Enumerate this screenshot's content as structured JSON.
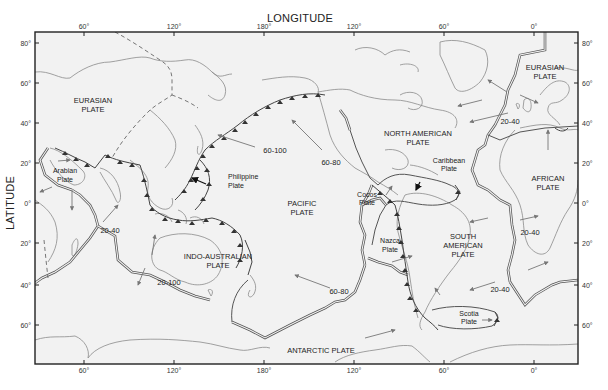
{
  "figure": {
    "x_axis_title": "LONGITUDE",
    "y_axis_title": "LATITUDE",
    "top_ticks": [
      "60°",
      "120°",
      "180°",
      "120°",
      "60°",
      "0°"
    ],
    "bottom_ticks": [
      "60°",
      "120°",
      "180°",
      "120°",
      "60°",
      "0°"
    ],
    "left_ticks": [
      "80°",
      "60°",
      "40°",
      "20°",
      "0°",
      "20°",
      "40°",
      "60°"
    ],
    "right_ticks": [
      "80°",
      "60°",
      "40°",
      "20°",
      "0°",
      "20°",
      "40°",
      "60°"
    ],
    "colors": {
      "background": "#ffffff",
      "map_fill": "#f2f2f2",
      "frame": "#222222",
      "coastline": "#8a8a8a",
      "plate_boundary": "#555555",
      "motion_arrow": "#777777"
    }
  },
  "plates": {
    "eurasian_west": [
      "EURASIAN",
      "PLATE"
    ],
    "eurasian_east": [
      "EURASIAN",
      "PLATE"
    ],
    "north_american": [
      "NORTH AMERICAN",
      "PLATE"
    ],
    "pacific": [
      "PACIFIC",
      "PLATE"
    ],
    "african": [
      "AFRICAN",
      "PLATE"
    ],
    "south_american": [
      "SOUTH",
      "AMERICAN",
      "PLATE"
    ],
    "indo_australian": [
      "INDO-AUSTRALIAN",
      "PLATE"
    ],
    "antarctic": [
      "ANTARCTIC PLATE"
    ],
    "arabian": [
      "Arabian",
      "Plate"
    ],
    "philippine": [
      "Philippine",
      "Plate"
    ],
    "caribbean": [
      "Caribbean",
      "Plate"
    ],
    "cocos": [
      "Cocos",
      "Plate"
    ],
    "nazca": [
      "Nazca",
      "Plate"
    ],
    "scotia": [
      "Scotia",
      "Plate"
    ]
  },
  "rates": {
    "pacific_nw": "60-100",
    "pacific_ne": "60-80",
    "pacific_s": "60-80",
    "indian_ocean": "20-40",
    "indo_australian_s": "20-100",
    "north_atlantic": "20-40",
    "south_atlantic_e": "20-40",
    "south_atlantic_s": "20-40"
  }
}
